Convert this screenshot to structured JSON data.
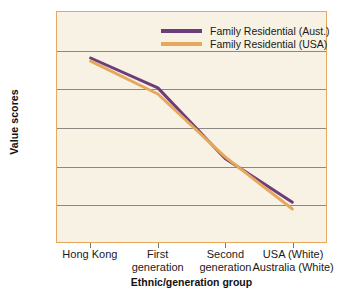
{
  "chart_data": {
    "type": "line",
    "title": "",
    "xlabel": "Ethnic/generation group",
    "ylabel": "Value scores",
    "categories": [
      "Hong Kong",
      "First generation",
      "Second generation",
      "USA (White) Australia (White)"
    ],
    "category_lines": [
      [
        "Hong Kong"
      ],
      [
        "First",
        "generation"
      ],
      [
        "Second",
        "generation"
      ],
      [
        "USA (White)",
        "Australia (White)"
      ]
    ],
    "series": [
      {
        "name": "Family Residential (Aust.)",
        "color": "#6B3D7A",
        "values": [
          4.4,
          4.01,
          3.09,
          2.52
        ]
      },
      {
        "name": "Family Residential (USA)",
        "color": "#E8A85C",
        "values": [
          4.36,
          3.93,
          3.11,
          2.43
        ]
      }
    ],
    "ylim": [
      2,
      5
    ],
    "yticks": [
      "2",
      "2.5",
      "3",
      "3.5",
      "4",
      "4.5",
      "5"
    ],
    "ytick_values": [
      2,
      2.5,
      3,
      3.5,
      4,
      4.5,
      5
    ],
    "grid": true,
    "legend_position": "top-right",
    "colors": {
      "plot_background": "#F7F2E4",
      "plot_border": "#E8A85C",
      "gridline": "#8A8A82",
      "text": "#1a1a1a"
    }
  }
}
